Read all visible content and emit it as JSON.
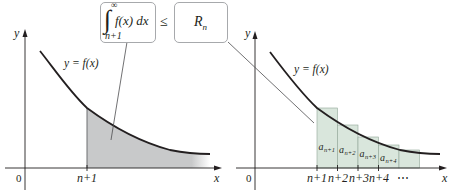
{
  "colors": {
    "ink": "#231f20",
    "integral_shade": "#c8c9ca",
    "rect_fill": "#d9e6dc",
    "rect_stroke": "#8fa596",
    "box_border": "#a7a9ac",
    "leader": "#4d4d4f"
  },
  "top_inequality": {
    "integral_sign": "∫",
    "upper_limit": "∞",
    "lower_limit": "n+1",
    "integrand": "f(x) dx",
    "relation": "≤",
    "rhs": "R",
    "rhs_sub": "n"
  },
  "left_panel": {
    "y_axis_label": "y",
    "x_axis_label": "x",
    "origin_label": "0",
    "curve_label": "y = f(x)",
    "tick_label": "n+1",
    "shaded_region": "area under f(x) from n+1 to ∞"
  },
  "right_panel": {
    "y_axis_label": "y",
    "x_axis_label": "x",
    "origin_label": "0",
    "curve_label": "y = f(x)",
    "tick_labels": [
      "n+1",
      "n+2",
      "n+3",
      "n+4",
      "⋯"
    ],
    "rectangles": [
      {
        "label": "a",
        "sub": "n+1"
      },
      {
        "label": "a",
        "sub": "n+2"
      },
      {
        "label": "a",
        "sub": "n+3"
      },
      {
        "label": "a",
        "sub": "n+4"
      },
      {
        "label": "",
        "sub": ""
      }
    ]
  }
}
